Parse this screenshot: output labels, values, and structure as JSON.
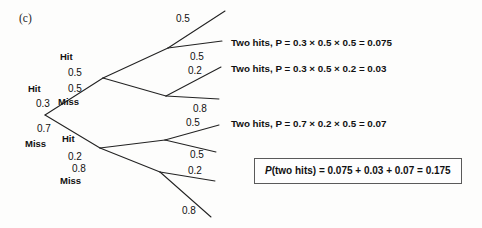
{
  "figure": {
    "panel_letter": "(c)",
    "type": "probability-tree-diagram"
  },
  "nodes": {
    "level1": [
      {
        "label": "Hit",
        "probability": "0.3"
      },
      {
        "label": "Miss",
        "probability": "0.7"
      }
    ],
    "level2": [
      {
        "label": "Hit",
        "probability": "0.5"
      },
      {
        "label": "Miss",
        "probability": "0.5"
      },
      {
        "label": "Hit",
        "probability": "0.2"
      },
      {
        "label": "Miss",
        "probability": "0.8"
      }
    ],
    "level3": [
      {
        "probability": "0.5"
      },
      {
        "probability": "0.5"
      },
      {
        "probability": "0.2"
      },
      {
        "probability": "0.8"
      },
      {
        "probability": "0.5"
      },
      {
        "probability": "0.5"
      },
      {
        "probability": "0.2"
      },
      {
        "probability": "0.8"
      }
    ]
  },
  "branch_probabilities": {
    "p_hit_1": "0.3",
    "p_miss_1": "0.7",
    "p_hit_hit": "0.5",
    "p_hit_miss": "0.5",
    "p_miss_hit": "0.2",
    "p_miss_miss": "0.8",
    "p_l3_a": "0.5",
    "p_l3_b": "0.5",
    "p_l3_c": "0.2",
    "p_l3_d": "0.8",
    "p_l3_e": "0.5",
    "p_l3_f": "0.5",
    "p_l3_g": "0.2",
    "p_l3_h": "0.8"
  },
  "outcomes": [
    {
      "name": "Two hits,",
      "expression": "P = 0.3 × 0.5 × 0.5 = 0.075",
      "value": "0.075"
    },
    {
      "name": "Two hits,",
      "expression": "P = 0.3 × 0.5 × 0.2 = 0.03",
      "value": "0.03"
    },
    {
      "name": "Two hits,",
      "expression": "P = 0.7 × 0.2 × 0.5 = 0.07",
      "value": "0.07"
    }
  ],
  "summary": {
    "prefix": "P",
    "text": "(two hits) = 0.075 + 0.03 + 0.07 = 0.175",
    "total": "0.175"
  },
  "colors": {
    "line": "#222222",
    "text": "#111111",
    "box_border": "#5a5a5a",
    "background": "#fdfdfc"
  }
}
